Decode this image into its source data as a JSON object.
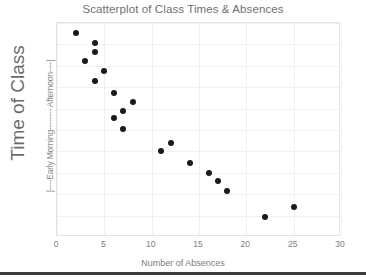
{
  "chart_data": {
    "type": "scatter",
    "title": "Scatterplot of Class Times & Absences",
    "xlabel": "Number of Absences",
    "ylabel": "Time of Class",
    "y_scale_label": "|----Early Morning-------- Afternoon----|",
    "xlim": [
      0,
      30
    ],
    "ylim": [
      0,
      10
    ],
    "xticks": [
      0,
      5,
      10,
      15,
      20,
      25,
      30
    ],
    "xtick_labels": [
      "0",
      "5",
      "10",
      "15",
      "20",
      "25",
      "30"
    ],
    "yticks": [],
    "ytick_labels": [],
    "grid": true,
    "legend": false,
    "marker_color": "#1a1a1a",
    "marker_size": 6,
    "series": [
      {
        "name": "Class sections",
        "points": [
          {
            "x": 2,
            "y": 9.55
          },
          {
            "x": 4,
            "y": 9.05
          },
          {
            "x": 4,
            "y": 8.65
          },
          {
            "x": 3,
            "y": 8.25
          },
          {
            "x": 5,
            "y": 7.75
          },
          {
            "x": 4,
            "y": 7.3
          },
          {
            "x": 6,
            "y": 6.75
          },
          {
            "x": 8,
            "y": 6.3
          },
          {
            "x": 7,
            "y": 5.9
          },
          {
            "x": 6,
            "y": 5.55
          },
          {
            "x": 7,
            "y": 5.05
          },
          {
            "x": 12,
            "y": 4.4
          },
          {
            "x": 11,
            "y": 4.0
          },
          {
            "x": 14,
            "y": 3.45
          },
          {
            "x": 16,
            "y": 3.0
          },
          {
            "x": 17,
            "y": 2.6
          },
          {
            "x": 18,
            "y": 2.15
          },
          {
            "x": 25,
            "y": 1.4
          },
          {
            "x": 22,
            "y": 0.95
          }
        ]
      }
    ]
  },
  "axis": {
    "x_gridlines": [
      0,
      5,
      10,
      15,
      20,
      25,
      30
    ],
    "y_gridlines": [
      1,
      2,
      3,
      4,
      5,
      6,
      7,
      8,
      9,
      10
    ]
  }
}
